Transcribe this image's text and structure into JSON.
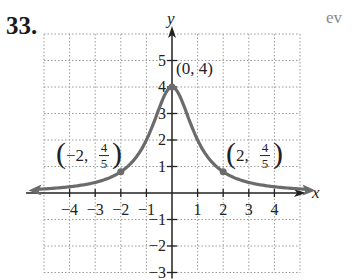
{
  "problem": {
    "number": "33."
  },
  "corner_text": "ev",
  "chart_data": {
    "type": "line",
    "title": "",
    "xlabel": "x",
    "ylabel": "y",
    "xlim": [
      -5,
      5
    ],
    "ylim": [
      -3,
      6
    ],
    "grid": true,
    "x_ticks": [
      -4,
      -3,
      -2,
      -1,
      1,
      2,
      3,
      4
    ],
    "x_tick_labels": [
      "−4",
      "−3",
      "−2",
      "−1",
      "1",
      "2",
      "3",
      "4"
    ],
    "y_ticks": [
      -3,
      -2,
      -1,
      1,
      2,
      3,
      4,
      5
    ],
    "y_tick_labels": [
      "−3",
      "−2",
      "−1",
      "1",
      "2",
      "3",
      "4",
      "5"
    ],
    "function": "f(x) = 4/(x^2+1)",
    "series": [
      {
        "name": "curve",
        "x": [
          -5.4,
          -4,
          -3,
          -2,
          -1.5,
          -1,
          -0.5,
          0,
          0.5,
          1,
          1.5,
          2,
          3,
          4,
          5.4
        ],
        "y": [
          0.13,
          0.24,
          0.4,
          0.8,
          1.23,
          2,
          3.2,
          4,
          3.2,
          2,
          1.23,
          0.8,
          0.4,
          0.24,
          0.13
        ]
      }
    ],
    "labeled_points": [
      {
        "x": 0,
        "y": 4,
        "label": "(0, 4)"
      },
      {
        "x": -2,
        "y": 0.8,
        "label_prefix": "−2,",
        "label_num": "4",
        "label_den": "5"
      },
      {
        "x": 2,
        "y": 0.8,
        "label_prefix": "2,",
        "label_num": "4",
        "label_den": "5"
      }
    ]
  }
}
